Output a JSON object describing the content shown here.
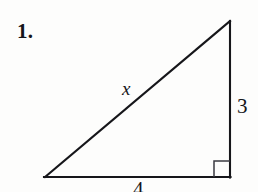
{
  "figure": {
    "problem_number": "1.",
    "type": "right-triangle-diagram",
    "ink_color": "#16161a",
    "background_color": "#fdfdfc",
    "labels": {
      "hypotenuse": "x",
      "vertical_leg": "3",
      "base_leg": "4"
    },
    "geometry": {
      "left_vertex": [
        45,
        177
      ],
      "apex_vertex": [
        230,
        21
      ],
      "right_angle_vertex": [
        230,
        177
      ],
      "right_angle_marker_size": 16,
      "stroke_width": 2.1
    }
  }
}
